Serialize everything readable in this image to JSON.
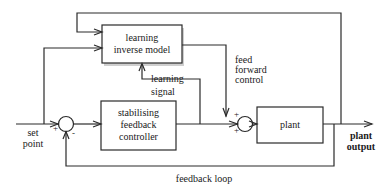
{
  "diagram": {
    "type": "control-system block diagram",
    "blocks": {
      "learning_inverse_model": {
        "line1": "learning",
        "line2": "inverse model"
      },
      "stabilising_controller": {
        "line1": "stabilising",
        "line2": "feedback",
        "line3": "controller"
      },
      "plant": {
        "label": "plant"
      }
    },
    "labels": {
      "set_point_1": "set",
      "set_point_2": "point",
      "plant_output_1": "plant",
      "plant_output_2": "output",
      "learning_signal_1": "learning",
      "learning_signal_2": "signal",
      "feed_forward_1": "feed",
      "feed_forward_2": "forward",
      "feed_forward_3": "control",
      "feedback_loop": "feedback loop"
    },
    "summing_junctions": {
      "left": {
        "plus": "+",
        "minus": "-"
      },
      "right": {
        "plus_top": "+",
        "plus_left": "+"
      }
    }
  }
}
